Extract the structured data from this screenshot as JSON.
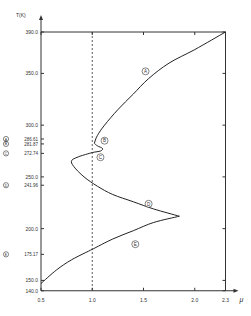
{
  "chart_data": {
    "type": "line",
    "title": "",
    "xlabel": "μ",
    "ylabel": "T(K)",
    "xlim": [
      0.5,
      2.3
    ],
    "ylim": [
      140.0,
      390.0
    ],
    "x_ticks": [
      "0.5",
      "1.0",
      "1.5",
      "2.0",
      "2.3"
    ],
    "y_ticks": [
      "390.0",
      "350.0",
      "300.0",
      "250.0",
      "200.0",
      "150.0",
      "140.0"
    ],
    "marked_y_ticks": [
      {
        "marker": "A",
        "value": "286.61"
      },
      {
        "marker": "B",
        "value": "281.87"
      },
      {
        "marker": "C",
        "value": "272.74"
      },
      {
        "marker": "D",
        "value": "241.96"
      },
      {
        "marker": "E",
        "value": "175.17"
      }
    ],
    "reference_line": {
      "x": 1.0,
      "style": "dashed"
    },
    "grid": false,
    "series": [
      {
        "name": "A",
        "points": [
          [
            1.02,
            282.5
          ],
          [
            1.05,
            290
          ],
          [
            1.12,
            300
          ],
          [
            1.25,
            315
          ],
          [
            1.4,
            330
          ],
          [
            1.55,
            345
          ],
          [
            1.75,
            360
          ],
          [
            2.0,
            373
          ],
          [
            2.3,
            390
          ]
        ]
      },
      {
        "name": "B",
        "points": [
          [
            1.02,
            282.5
          ],
          [
            1.05,
            280
          ],
          [
            1.1,
            277.5
          ],
          [
            1.08,
            275
          ],
          [
            1.0,
            273.5
          ],
          [
            0.88,
            270
          ]
        ]
      },
      {
        "name": "C",
        "points": [
          [
            0.88,
            270
          ],
          [
            0.8,
            266
          ],
          [
            0.82,
            260
          ],
          [
            0.92,
            250
          ],
          [
            1.05,
            241
          ],
          [
            1.2,
            233
          ],
          [
            1.4,
            226
          ],
          [
            1.6,
            219
          ],
          [
            1.85,
            212
          ]
        ]
      },
      {
        "name": "D",
        "points": [
          [
            1.85,
            212
          ],
          [
            1.6,
            206
          ],
          [
            1.4,
            198
          ],
          [
            1.2,
            190
          ],
          [
            1.0,
            180
          ]
        ]
      },
      {
        "name": "E",
        "points": [
          [
            1.0,
            180
          ],
          [
            0.8,
            170
          ],
          [
            0.65,
            160
          ],
          [
            0.5,
            147
          ]
        ]
      }
    ],
    "curve_labels": [
      {
        "text": "A",
        "x": 1.52,
        "y": 352
      },
      {
        "text": "B",
        "x": 1.12,
        "y": 285
      },
      {
        "text": "C",
        "x": 1.08,
        "y": 269
      },
      {
        "text": "D",
        "x": 1.55,
        "y": 224
      },
      {
        "text": "E",
        "x": 1.42,
        "y": 185
      }
    ]
  }
}
